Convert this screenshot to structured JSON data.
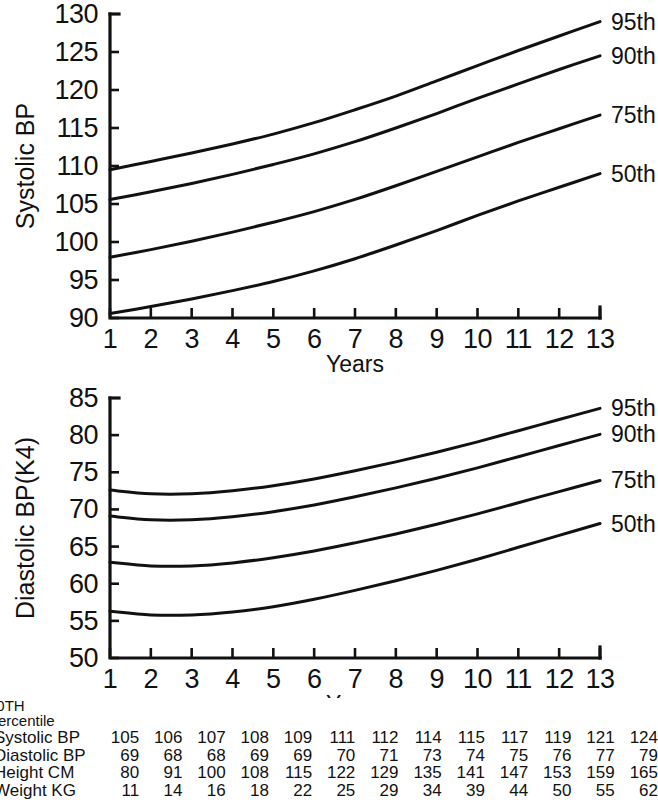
{
  "chart_data": [
    {
      "id": "systolic",
      "type": "line",
      "title": "",
      "xlabel": "Years",
      "ylabel": "Systolic BP",
      "xlim": [
        1,
        13
      ],
      "ylim": [
        90,
        130
      ],
      "ytick_step": 5,
      "yticks": [
        90,
        95,
        100,
        105,
        110,
        115,
        120,
        125,
        130
      ],
      "xticks": [
        1,
        2,
        3,
        4,
        5,
        6,
        7,
        8,
        9,
        10,
        11,
        12,
        13
      ],
      "grid": false,
      "legend_position": "right-inline",
      "x": [
        1,
        2,
        3,
        4,
        5,
        6,
        7,
        8,
        9,
        10,
        11,
        12,
        13
      ],
      "series": [
        {
          "name": "95th",
          "values": [
            109.5,
            110.6,
            111.7,
            112.9,
            114.2,
            115.7,
            117.4,
            119.2,
            121.2,
            123.2,
            125.2,
            127.1,
            129.0
          ]
        },
        {
          "name": "90th",
          "values": [
            105.6,
            106.6,
            107.7,
            108.9,
            110.2,
            111.6,
            113.2,
            115.0,
            116.9,
            118.9,
            120.8,
            122.7,
            124.5
          ]
        },
        {
          "name": "75th",
          "values": [
            98.0,
            99.0,
            100.1,
            101.3,
            102.6,
            104.0,
            105.6,
            107.4,
            109.3,
            111.2,
            113.1,
            114.9,
            116.7
          ]
        },
        {
          "name": "50th",
          "values": [
            90.6,
            91.5,
            92.5,
            93.6,
            94.8,
            96.2,
            97.8,
            99.6,
            101.5,
            103.5,
            105.4,
            107.2,
            109.0
          ]
        }
      ]
    },
    {
      "id": "diastolic",
      "type": "line",
      "title": "",
      "xlabel": "Years",
      "ylabel": "Diastolic BP(K4)",
      "xlim": [
        1,
        13
      ],
      "ylim": [
        50,
        85
      ],
      "ytick_step": 5,
      "yticks": [
        50,
        55,
        60,
        65,
        70,
        75,
        80,
        85
      ],
      "xticks": [
        1,
        2,
        3,
        4,
        5,
        6,
        7,
        8,
        9,
        10,
        11,
        12,
        13
      ],
      "grid": false,
      "legend_position": "right-inline",
      "x": [
        1,
        2,
        3,
        4,
        5,
        6,
        7,
        8,
        9,
        10,
        11,
        12,
        13
      ],
      "series": [
        {
          "name": "95th",
          "values": [
            72.6,
            72.1,
            72.1,
            72.5,
            73.2,
            74.1,
            75.2,
            76.4,
            77.7,
            79.1,
            80.6,
            82.1,
            83.6
          ]
        },
        {
          "name": "90th",
          "values": [
            69.1,
            68.6,
            68.6,
            69.0,
            69.7,
            70.6,
            71.7,
            72.9,
            74.2,
            75.6,
            77.1,
            78.6,
            80.1
          ]
        },
        {
          "name": "75th",
          "values": [
            62.9,
            62.4,
            62.4,
            62.8,
            63.5,
            64.4,
            65.5,
            66.7,
            68.0,
            69.4,
            70.9,
            72.4,
            73.9
          ]
        },
        {
          "name": "50th",
          "values": [
            56.3,
            55.8,
            55.8,
            56.2,
            56.9,
            57.9,
            59.1,
            60.4,
            61.8,
            63.3,
            64.9,
            66.5,
            68.1
          ]
        }
      ]
    }
  ],
  "table": {
    "header_line1": "90TH",
    "header_line2": "Percentile",
    "columns": [
      1,
      2,
      3,
      4,
      5,
      6,
      7,
      8,
      9,
      10,
      11,
      12,
      13
    ],
    "rows": [
      {
        "label": "Systolic BP",
        "values": [
          105,
          106,
          107,
          108,
          109,
          111,
          112,
          114,
          115,
          117,
          119,
          121,
          124
        ]
      },
      {
        "label": "Diastolic BP",
        "values": [
          69,
          68,
          68,
          69,
          69,
          70,
          71,
          73,
          74,
          75,
          76,
          77,
          79
        ]
      },
      {
        "label": "Height CM",
        "values": [
          80,
          91,
          100,
          108,
          115,
          122,
          129,
          135,
          141,
          147,
          153,
          159,
          165
        ]
      },
      {
        "label": "Weight KG",
        "values": [
          11,
          14,
          16,
          18,
          22,
          25,
          29,
          34,
          39,
          44,
          50,
          55,
          62
        ]
      }
    ]
  },
  "style": {
    "ink": "#111111",
    "background": "#ffffff"
  }
}
